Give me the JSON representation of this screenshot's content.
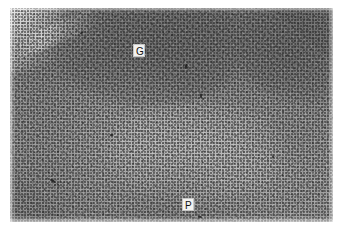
{
  "figure": {
    "domain": "Natural-Image",
    "kind": "light-microscopy-histology-micrograph",
    "stain": "hematoxylin and eosin (grayscale reproduction)",
    "width_px": 341,
    "height_px": 237,
    "background_color": "#ffffff"
  },
  "plate": {
    "left_px": 10,
    "top_px": 8,
    "width_px": 323,
    "height_px": 214,
    "base_color": "#9d9d9d",
    "tone_range": [
      "#5a5a5a",
      "#e6e6e6"
    ]
  },
  "labels": [
    {
      "id": "label-g",
      "text": "G",
      "meaning": "germinal center",
      "x_px": 123,
      "y_px": 36,
      "text_color": "#111111",
      "box_color": "#f2f2f0"
    },
    {
      "id": "label-p",
      "text": "P",
      "meaning": "paracortex",
      "x_px": 172,
      "y_px": 190,
      "text_color": "#111111",
      "box_color": "#f2f2f0"
    }
  ],
  "regions": [
    {
      "name": "germinal-center-follicle",
      "description": "darker, denser rounded lymphoid follicle, upper centre-left",
      "relative_density": "high"
    },
    {
      "name": "right-follicle",
      "description": "second darker follicle along the right margin",
      "relative_density": "high"
    },
    {
      "name": "paracortex",
      "description": "paler, more uniformly speckled zone occupying the lower half",
      "relative_density": "moderate"
    },
    {
      "name": "capsule-subcapsular-sinus",
      "description": "pale diagonal streak across the upper-left corner",
      "relative_density": "low"
    }
  ]
}
